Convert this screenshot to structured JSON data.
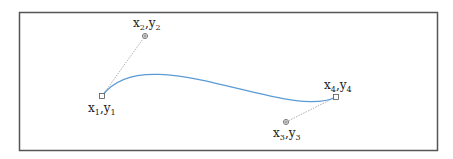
{
  "figure": {
    "type": "cubic-bezier-curve-diagram",
    "frame": {
      "x": 19,
      "y": 12,
      "width": 418,
      "height": 138,
      "border_color": "#555555"
    },
    "curve": {
      "color": "#5b9bd5",
      "width": 1.2
    },
    "handle_line_color": "#999999",
    "points": {
      "p1": {
        "role": "start-anchor",
        "x": 102,
        "y": 96,
        "marker": "square",
        "label": {
          "base_x": "x",
          "sub_x": "1",
          "sep": ",",
          "base_y": "y",
          "sub_y": "1"
        }
      },
      "p2": {
        "role": "control-point",
        "x": 145,
        "y": 36,
        "marker": "circle-plus",
        "label": {
          "base_x": "x",
          "sub_x": "2",
          "sep": ",",
          "base_y": "y",
          "sub_y": "2"
        }
      },
      "p3": {
        "role": "control-point",
        "x": 286,
        "y": 122,
        "marker": "circle-plus",
        "label": {
          "base_x": "x",
          "sub_x": "3",
          "sep": ",",
          "base_y": "y",
          "sub_y": "3"
        }
      },
      "p4": {
        "role": "end-anchor",
        "x": 336,
        "y": 97,
        "marker": "square",
        "label": {
          "base_x": "x",
          "sub_x": "4",
          "sep": ",",
          "base_y": "y",
          "sub_y": "4"
        }
      }
    }
  }
}
